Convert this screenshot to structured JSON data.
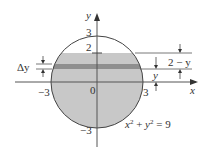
{
  "diagram": {
    "equation": "x² + y² = 9",
    "equation_parts": {
      "x": "x",
      "xexp": "2",
      "plus": " + ",
      "y": "y",
      "yexp": "2",
      "eq": " = 9"
    },
    "axes": {
      "x_label": "x",
      "y_label": "y"
    },
    "ticks": {
      "y_top": "3",
      "y_level": "2",
      "y_bottom": "−3",
      "x_left": "−3",
      "x_right": "3",
      "origin": "0"
    },
    "annotations": {
      "delta_y": "Δy",
      "y_dist": "y",
      "two_minus_y": "2 − y"
    },
    "colors": {
      "fill": "#c8c8c8",
      "strip": "#8f8f8f",
      "stroke": "#444444",
      "axis": "#555555"
    }
  }
}
